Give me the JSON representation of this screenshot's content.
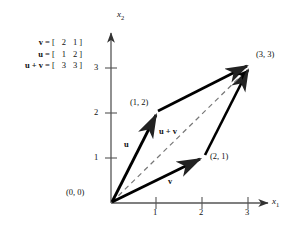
{
  "figure": {
    "equations": [
      {
        "lhs": "v",
        "eq": "=",
        "open": "[",
        "a": "2",
        "b": "1",
        "close": "]"
      },
      {
        "lhs": "u",
        "eq": "=",
        "open": "[",
        "a": "1",
        "b": "2",
        "close": "]"
      },
      {
        "lhs": "u + v",
        "eq": "=",
        "open": "[",
        "a": "3",
        "b": "3",
        "close": "]"
      }
    ],
    "axes": {
      "x_label": "x",
      "x_sub": "1",
      "y_label": "x",
      "y_sub": "2",
      "x_ticks": [
        "1",
        "2",
        "3"
      ],
      "y_ticks": [
        "1",
        "2",
        "3"
      ],
      "origin_label": "(0, 0)"
    },
    "points": [
      {
        "name": "u-tip",
        "label": "(1, 2)",
        "x": 1,
        "y": 2
      },
      {
        "name": "v-tip",
        "label": "(2, 1)",
        "x": 2,
        "y": 1
      },
      {
        "name": "sum-tip",
        "label": "(3, 3)",
        "x": 3,
        "y": 3
      }
    ],
    "vector_labels": {
      "u": "u",
      "v": "v",
      "sum": "u + v"
    },
    "colors": {
      "stroke": "#000000",
      "axis": "#555555",
      "dashed": "#777777",
      "background": "#ffffff"
    }
  }
}
